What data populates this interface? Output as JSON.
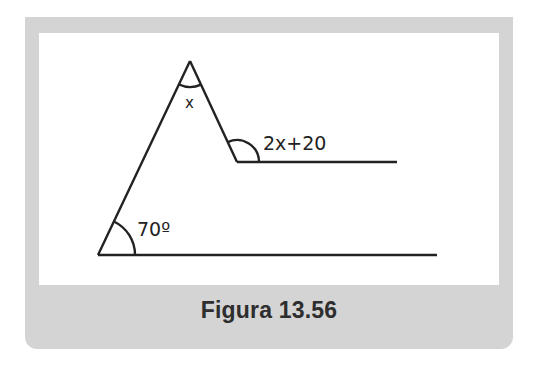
{
  "figure": {
    "caption": "Figura 13.56",
    "colors": {
      "frame": "#d4d4d4",
      "panel": "#ffffff",
      "stroke": "#222222",
      "caption_text": "#2e2e2e"
    },
    "labels": {
      "apex_angle": "x",
      "inner_angle": "2x+20",
      "base_angle": "70º"
    },
    "points": {
      "apex": [
        190,
        61
      ],
      "base_vertex": [
        98,
        255
      ],
      "inner_vertex": [
        237,
        162
      ],
      "upper_line_end": [
        397,
        162
      ],
      "base_line_end": [
        437,
        255
      ]
    }
  }
}
